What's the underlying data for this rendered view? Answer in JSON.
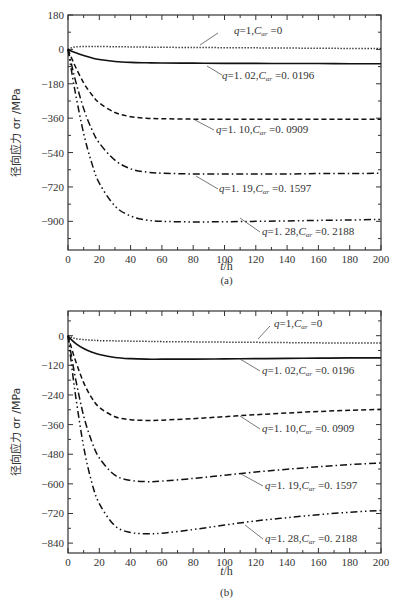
{
  "chart_data": [
    {
      "type": "line",
      "panel": "(a)",
      "caption": "(a)",
      "title": "",
      "xlabel": "t/h",
      "ylabel": "径向应力 σr /MPa",
      "xlim": [
        0,
        200
      ],
      "ylim": [
        -1050,
        180
      ],
      "xticks": [
        0,
        20,
        40,
        60,
        80,
        100,
        120,
        140,
        160,
        180,
        200
      ],
      "yticks": [
        180,
        0,
        -180,
        -360,
        -540,
        -720,
        -900
      ],
      "ytick_labels": [
        "180",
        "0",
        "−180",
        "−360",
        "−540",
        "−720",
        "−900"
      ],
      "grid": false,
      "legend": "inline annotations",
      "x": [
        0,
        2,
        5,
        10,
        15,
        20,
        30,
        40,
        50,
        60,
        80,
        100,
        120,
        140,
        160,
        180,
        200
      ],
      "series": [
        {
          "name": "q=1, Cαr=0",
          "style": "dotted",
          "label": "q=1, Cαr=0",
          "values": [
            0,
            8,
            13,
            15,
            15,
            15,
            14,
            13,
            12,
            11,
            10,
            9,
            8,
            7,
            6,
            5,
            5
          ]
        },
        {
          "name": "q=1.02, Cαr=0.0196",
          "style": "solid",
          "label": "q=1.02, Cαr=0.0196",
          "values": [
            0,
            -8,
            -18,
            -32,
            -44,
            -53,
            -63,
            -68,
            -70,
            -71,
            -72,
            -73,
            -73,
            -74,
            -74,
            -75,
            -75
          ]
        },
        {
          "name": "q=1.10, Cαr=0.0909",
          "style": "dashed",
          "label": "q=1.10, Cαr=0.0909",
          "values": [
            0,
            -40,
            -95,
            -175,
            -235,
            -280,
            -330,
            -352,
            -360,
            -363,
            -365,
            -365,
            -365,
            -365,
            -365,
            -365,
            -365
          ]
        },
        {
          "name": "q=1.19, Cαr=0.1597",
          "style": "dashdot",
          "label": "q=1.19, Cαr=0.1597",
          "values": [
            0,
            -70,
            -170,
            -310,
            -415,
            -490,
            -580,
            -625,
            -642,
            -648,
            -652,
            -652,
            -652,
            -652,
            -650,
            -650,
            -648
          ]
        },
        {
          "name": "q=1.28, Cαr=0.2188",
          "style": "dashdotdot",
          "label": "q=1.28, Cαr=0.2188",
          "values": [
            0,
            -100,
            -240,
            -440,
            -590,
            -700,
            -820,
            -872,
            -893,
            -900,
            -903,
            -902,
            -900,
            -898,
            -895,
            -893,
            -890
          ]
        }
      ],
      "annotations": [
        {
          "text": "q=1, Cαr=0",
          "q": "q=1",
          "c": "Cαr=0",
          "series": 0
        },
        {
          "text": "q=1.02, Cαr=0.0196",
          "series": 1
        },
        {
          "text": "q=1.10, Cαr=0.0909",
          "series": 2
        },
        {
          "text": "q=1.19, Cαr=0.1597",
          "series": 3
        },
        {
          "text": "q=1.28, Cαr=0.2188",
          "series": 4
        }
      ]
    },
    {
      "type": "line",
      "panel": "(b)",
      "caption": "(b)",
      "title": "",
      "xlabel": "t/h",
      "ylabel": "径向应力 σr /MPa",
      "xlim": [
        0,
        200
      ],
      "ylim": [
        -880,
        100
      ],
      "xticks": [
        0,
        20,
        40,
        60,
        80,
        100,
        120,
        140,
        160,
        180,
        200
      ],
      "yticks": [
        0,
        -120,
        -240,
        -360,
        -480,
        -600,
        -720,
        -840
      ],
      "ytick_labels": [
        "0",
        "−120",
        "−240",
        "−360",
        "−480",
        "−600",
        "−720",
        "−840"
      ],
      "grid": false,
      "legend": "inline annotations",
      "x": [
        0,
        2,
        5,
        10,
        15,
        20,
        30,
        40,
        50,
        60,
        80,
        100,
        120,
        140,
        160,
        180,
        200
      ],
      "series": [
        {
          "name": "q=1, Cαr=0",
          "style": "dotted",
          "label": "q=1, Cαr=0",
          "values": [
            0,
            -6,
            -12,
            -16,
            -18,
            -20,
            -21,
            -22,
            -23,
            -24,
            -25,
            -26,
            -27,
            -28,
            -29,
            -30,
            -30
          ]
        },
        {
          "name": "q=1.02, Cαr=0.0196",
          "style": "solid",
          "label": "q=1.02, Cαr=0.0196",
          "values": [
            0,
            -15,
            -32,
            -52,
            -66,
            -76,
            -88,
            -93,
            -95,
            -95,
            -95,
            -94,
            -93,
            -92,
            -91,
            -90,
            -90
          ]
        },
        {
          "name": "q=1.10, Cαr=0.0909",
          "style": "dashed",
          "label": "q=1.10, Cαr=0.0909",
          "values": [
            0,
            -45,
            -105,
            -190,
            -250,
            -290,
            -328,
            -340,
            -343,
            -342,
            -336,
            -328,
            -320,
            -313,
            -307,
            -302,
            -298
          ]
        },
        {
          "name": "q=1.19, Cαr=0.1597",
          "style": "dashdot",
          "label": "q=1.19, Cαr=0.1597",
          "values": [
            0,
            -75,
            -180,
            -325,
            -425,
            -495,
            -565,
            -586,
            -591,
            -589,
            -578,
            -565,
            -552,
            -541,
            -531,
            -522,
            -515
          ]
        },
        {
          "name": "q=1.28, Cαr=0.2188",
          "style": "dashdotdot",
          "label": "q=1.28, Cαr=0.2188",
          "values": [
            0,
            -105,
            -250,
            -450,
            -590,
            -680,
            -770,
            -797,
            -802,
            -800,
            -785,
            -767,
            -750,
            -737,
            -725,
            -715,
            -708
          ]
        }
      ],
      "annotations": [
        {
          "text": "q=1, Cαr=0",
          "series": 0
        },
        {
          "text": "q=1.02, Cαr=0.0196",
          "series": 1
        },
        {
          "text": "q=1.10, Cαr=0.0909",
          "series": 2
        },
        {
          "text": "q=1.19, Cαr=0.1597",
          "series": 3
        },
        {
          "text": "q=1.28, Cαr=0.2188",
          "series": 4
        }
      ]
    }
  ],
  "layout": {
    "panels": [
      {
        "left": 68,
        "right": 381,
        "top": 15,
        "bottom": 250,
        "xlabel_y": 270,
        "caption_y": 284,
        "ylabel_x": 14,
        "labels": [
          {
            "x": 234,
            "y": 34,
            "lx1": 200,
            "ly1": 45,
            "lx2": 218,
            "ly2": 33
          },
          {
            "x": 222,
            "y": 79,
            "lx1": 207,
            "ly1": 66,
            "lx2": 222,
            "ly2": 75
          },
          {
            "x": 216,
            "y": 133,
            "lx1": 195,
            "ly1": 120,
            "lx2": 214,
            "ly2": 130
          },
          {
            "x": 219,
            "y": 192,
            "lx1": 196,
            "ly1": 176,
            "lx2": 218,
            "ly2": 189
          },
          {
            "x": 262,
            "y": 235,
            "lx1": 240,
            "ly1": 218,
            "lx2": 260,
            "ly2": 232
          }
        ]
      },
      {
        "left": 68,
        "right": 381,
        "top": 311,
        "bottom": 553,
        "xlabel_y": 575,
        "caption_y": 596,
        "ylabel_x": 14,
        "labels": [
          {
            "x": 274,
            "y": 327,
            "lx1": 258,
            "ly1": 339,
            "lx2": 270,
            "ly2": 326
          },
          {
            "x": 262,
            "y": 374,
            "lx1": 240,
            "ly1": 359,
            "lx2": 260,
            "ly2": 371
          },
          {
            "x": 262,
            "y": 432,
            "lx1": 240,
            "ly1": 416,
            "lx2": 260,
            "ly2": 429
          },
          {
            "x": 265,
            "y": 489,
            "lx1": 241,
            "ly1": 474,
            "lx2": 263,
            "ly2": 486
          },
          {
            "x": 265,
            "y": 542,
            "lx1": 245,
            "ly1": 525,
            "lx2": 263,
            "ly2": 539
          }
        ]
      }
    ],
    "dash": {
      "solid": "",
      "dotted": "1.2 1.8",
      "dashed": "5 3",
      "dashdot": "7 3 1.5 3",
      "dashdotdot": "7 3 1.5 3 1.5 3"
    },
    "line_color": "#111111",
    "axis_color": "#333333"
  }
}
